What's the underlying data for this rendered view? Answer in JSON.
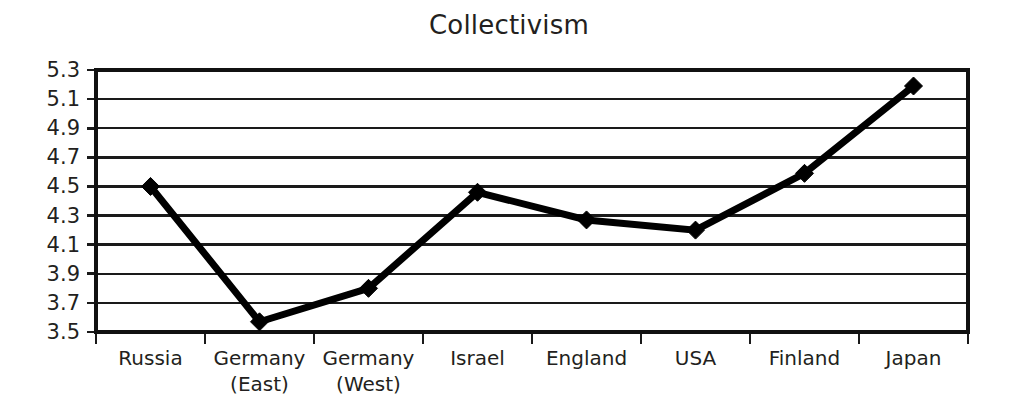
{
  "chart_data": {
    "type": "line",
    "title": "Collectivism",
    "xlabel": "",
    "ylabel": "",
    "categories": [
      "Russia",
      "Germany (East)",
      "Germany (West)",
      "Israel",
      "England",
      "USA",
      "Finland",
      "Japan"
    ],
    "category_labels": [
      {
        "line1": "Russia",
        "line2": ""
      },
      {
        "line1": "Germany",
        "line2": "(East)"
      },
      {
        "line1": "Germany",
        "line2": "(West)"
      },
      {
        "line1": "Israel",
        "line2": ""
      },
      {
        "line1": "England",
        "line2": ""
      },
      {
        "line1": "USA",
        "line2": ""
      },
      {
        "line1": "Finland",
        "line2": ""
      },
      {
        "line1": "Japan",
        "line2": ""
      }
    ],
    "values": [
      4.5,
      3.57,
      3.8,
      4.46,
      4.27,
      4.2,
      4.59,
      5.19
    ],
    "series": [
      {
        "name": "Collectivism",
        "values": [
          4.5,
          3.57,
          3.8,
          4.46,
          4.27,
          4.2,
          4.59,
          5.19
        ]
      }
    ],
    "ylim": [
      3.5,
      5.3
    ],
    "ytick_step": 0.2,
    "ytick_labels": [
      "5.3",
      "5.1",
      "4.9",
      "4.7",
      "4.5",
      "4.3",
      "4.1",
      "3.9",
      "3.7",
      "3.5"
    ],
    "ytick_values": [
      5.3,
      5.1,
      4.9,
      4.7,
      4.5,
      4.3,
      4.1,
      3.9,
      3.7,
      3.5
    ],
    "grid": {
      "horizontal": true,
      "vertical": false
    },
    "legend": {
      "visible": false,
      "position": "none"
    },
    "marker": "diamond",
    "colors": {
      "line": "#000000",
      "marker": "#000000",
      "grid": "#1a1a1a",
      "axis": "#111111",
      "text": "#231f20",
      "background": "#ffffff"
    }
  },
  "layout": {
    "plot": {
      "left": 96,
      "right": 968,
      "top": 70,
      "bottom": 332
    }
  }
}
